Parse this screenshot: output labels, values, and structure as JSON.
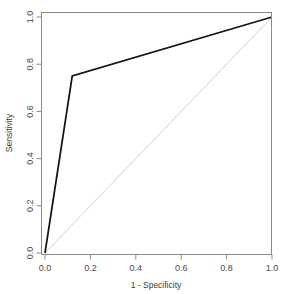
{
  "chart_data": {
    "type": "line",
    "title": "",
    "subtitle": "",
    "xlabel": "1 - Specificity",
    "ylabel": "Sensitivity",
    "xlim": [
      0.0,
      1.0
    ],
    "ylim": [
      0.0,
      1.0
    ],
    "grid": false,
    "legend": "none",
    "xticks": [
      "0.0",
      "0.2",
      "0.4",
      "0.6",
      "0.8",
      "1.0"
    ],
    "xtick_values": [
      0.0,
      0.2,
      0.4,
      0.6,
      0.8,
      1.0
    ],
    "yticks": [
      "0.0",
      "0.2",
      "0.4",
      "0.6",
      "0.8",
      "1.0"
    ],
    "ytick_values": [
      0.0,
      0.2,
      0.4,
      0.6,
      0.8,
      1.0
    ],
    "series": [
      {
        "name": "ROC curve",
        "color": "#121212",
        "x": [
          0.0,
          0.12,
          1.0
        ],
        "y": [
          0.0,
          0.75,
          1.0
        ]
      },
      {
        "name": "Chance diagonal",
        "color": "#d2d2d2",
        "x": [
          0.0,
          1.0
        ],
        "y": [
          0.0,
          1.0
        ]
      }
    ]
  },
  "colors": {
    "background": "#ffffff",
    "frame": "#8a8a8a",
    "curve": "#121212",
    "reference": "#d2d2d2",
    "text": "#3c3c3c"
  }
}
